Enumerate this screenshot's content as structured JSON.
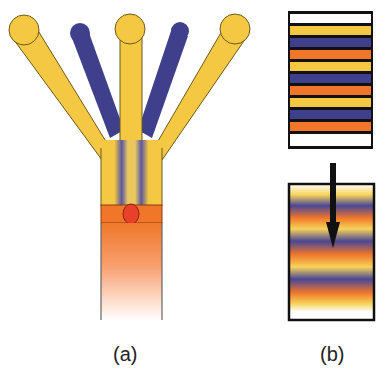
{
  "figure": {
    "panels": [
      {
        "id": "a",
        "label": "(a)",
        "description": "Microfluidic channel with five inlets (alternating yellow and blue streams) converging into a single channel, passing an orange mixing region with a red droplet, fading out downstream",
        "inlets": [
          {
            "color_name": "yellow",
            "color": "#f4c842"
          },
          {
            "color_name": "blue",
            "color": "#3f3f8c"
          },
          {
            "color_name": "yellow",
            "color": "#f4c842"
          },
          {
            "color_name": "blue",
            "color": "#3f3f8c"
          },
          {
            "color_name": "yellow",
            "color": "#f4c842"
          }
        ],
        "mixing_region_color": "#f0772a",
        "droplet_color": "#e8402a"
      },
      {
        "id": "b",
        "label": "(b)",
        "description": "Top: discrete laminated layers; bottom: diffused layered gradient with downward arrow",
        "top_layers": [
          "white",
          "yellow",
          "blue",
          "orange",
          "yellow",
          "blue",
          "orange",
          "yellow",
          "blue",
          "orange",
          "white"
        ],
        "bottom_layers": [
          "white",
          "yellow",
          "blue",
          "orange",
          "yellow",
          "blue",
          "orange",
          "yellow",
          "blue",
          "orange",
          "yellow",
          "white"
        ],
        "arrow_direction": "down"
      }
    ]
  },
  "colors": {
    "yellow": "#f4c842",
    "blue": "#3f3f8c",
    "orange": "#f0772a",
    "red": "#e8402a",
    "outline": "#6b5a1a",
    "frame": "#111111"
  }
}
